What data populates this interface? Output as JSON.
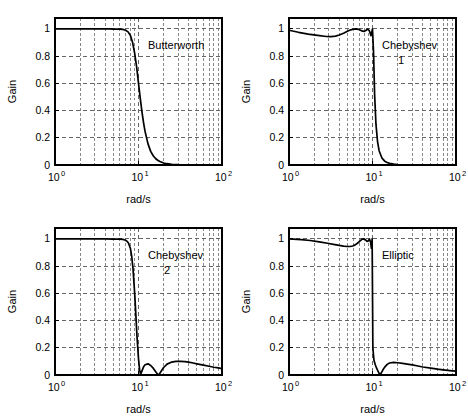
{
  "figure": {
    "title": "",
    "panel_count": 4,
    "background_color": "#ffffff",
    "curve_color": "#000000",
    "grid_color": "#555555",
    "axis_color": "#000000"
  },
  "axes": {
    "xlabel": "rad/s",
    "ylabel": "Gain",
    "x_ticklabels": [
      "10",
      "10",
      "10"
    ],
    "x_tickexponents": [
      "0",
      "1",
      "2"
    ],
    "y_ticklabels": [
      "0",
      "0.2",
      "0.4",
      "0.6",
      "0.8",
      "1"
    ],
    "xlim": [
      1,
      100
    ],
    "ylim": [
      0,
      1.08
    ],
    "xscale": "log",
    "yscale": "linear",
    "grid": true,
    "grid_style": "dashed",
    "y_gridvalues": [
      0.2,
      0.4,
      0.6,
      0.8,
      1.0
    ]
  },
  "chart_data": [
    {
      "type": "line",
      "panel": "top-left",
      "title": "Butterworth",
      "annotation": "Butterworth",
      "xlabel": "rad/s",
      "ylabel": "Gain",
      "xscale": "log",
      "xlim": [
        1,
        100
      ],
      "ylim": [
        0,
        1.08
      ],
      "grid": true,
      "legend": "none",
      "x": [
        1,
        1.5,
        2,
        2.5,
        3,
        3.5,
        4,
        4.5,
        5,
        5.5,
        6,
        6.5,
        7,
        7.5,
        8,
        8.5,
        9,
        9.5,
        10,
        10.5,
        11,
        11.5,
        12,
        13,
        14,
        15,
        16,
        17,
        18,
        20,
        22,
        25,
        30,
        35,
        40,
        50,
        60,
        80,
        100
      ],
      "y": [
        1.0,
        1.0,
        1.0,
        1.0,
        1.0,
        1.0,
        1.0,
        1.0,
        0.999,
        0.999,
        0.998,
        0.996,
        0.99,
        0.978,
        0.952,
        0.9,
        0.82,
        0.72,
        0.6,
        0.49,
        0.39,
        0.31,
        0.245,
        0.155,
        0.1,
        0.068,
        0.048,
        0.035,
        0.026,
        0.015,
        0.0095,
        0.0055,
        0.0022,
        0.0011,
        0.0006,
        0.0002,
        0.0001,
        3e-05,
        1e-05
      ]
    },
    {
      "type": "line",
      "panel": "top-right",
      "title": "Chebyshev 1",
      "annotation": "Chebyshev",
      "annotation_sub": "1",
      "xlabel": "rad/s",
      "ylabel": "Gain",
      "xscale": "log",
      "xlim": [
        1,
        100
      ],
      "ylim": [
        0,
        1.08
      ],
      "grid": true,
      "legend": "none",
      "x": [
        1,
        1.3,
        1.7,
        2.2,
        2.8,
        3.2,
        3.6,
        4.0,
        4.5,
        5.0,
        5.5,
        6.0,
        6.4,
        6.8,
        7.2,
        7.6,
        8.0,
        8.4,
        8.8,
        9.2,
        9.6,
        10.0,
        10.3,
        10.6,
        11,
        11.5,
        12,
        13,
        14,
        15,
        16,
        18,
        20,
        24,
        30,
        40,
        60,
        80,
        100
      ],
      "y": [
        0.99,
        0.975,
        0.962,
        0.952,
        0.944,
        0.943,
        0.947,
        0.955,
        0.968,
        0.982,
        0.993,
        0.999,
        1.0,
        0.997,
        0.99,
        0.983,
        0.982,
        0.99,
        0.999,
        0.985,
        0.95,
        0.999,
        0.82,
        0.52,
        0.3,
        0.17,
        0.105,
        0.05,
        0.028,
        0.018,
        0.012,
        0.006,
        0.0035,
        0.0016,
        0.0006,
        0.0002,
        5e-05,
        2e-05,
        1e-05
      ]
    },
    {
      "type": "line",
      "panel": "bottom-left",
      "title": "Chebyshev 2",
      "annotation": "Chebyshev",
      "annotation_sub": "2",
      "xlabel": "rad/s",
      "ylabel": "Gain",
      "xscale": "log",
      "xlim": [
        1,
        100
      ],
      "ylim": [
        0,
        1.08
      ],
      "grid": true,
      "legend": "none",
      "x": [
        1,
        2,
        3,
        4,
        5,
        5.5,
        6,
        6.5,
        7,
        7.3,
        7.6,
        8,
        8.3,
        8.6,
        9,
        9.3,
        9.6,
        10,
        10.3,
        10.6,
        11,
        11.5,
        12,
        13,
        14,
        15,
        16,
        17,
        17.5,
        18,
        19,
        20,
        22,
        25,
        28,
        32,
        36,
        40,
        45,
        50,
        60,
        70,
        80,
        90,
        100
      ],
      "y": [
        1.0,
        1.0,
        1.0,
        1.0,
        0.999,
        0.999,
        0.998,
        0.996,
        0.99,
        0.982,
        0.968,
        0.93,
        0.87,
        0.78,
        0.6,
        0.44,
        0.28,
        0.12,
        0.04,
        0.005,
        0.03,
        0.06,
        0.075,
        0.082,
        0.07,
        0.05,
        0.025,
        0.004,
        0.002,
        0.012,
        0.035,
        0.055,
        0.08,
        0.095,
        0.1,
        0.1,
        0.098,
        0.094,
        0.088,
        0.082,
        0.072,
        0.064,
        0.057,
        0.052,
        0.047
      ]
    },
    {
      "type": "line",
      "panel": "bottom-right",
      "title": "Elliptic",
      "annotation": "Elliptic",
      "xlabel": "rad/s",
      "ylabel": "Gain",
      "xscale": "log",
      "xlim": [
        1,
        100
      ],
      "ylim": [
        0,
        1.08
      ],
      "grid": true,
      "legend": "none",
      "x": [
        1,
        1.4,
        1.8,
        2.3,
        2.9,
        3.4,
        4.0,
        4.5,
        5.0,
        5.4,
        5.8,
        6.2,
        6.6,
        7.0,
        7.4,
        7.8,
        8.2,
        8.6,
        8.9,
        9.2,
        9.5,
        9.7,
        9.9,
        10.1,
        10.4,
        10.8,
        11.2,
        11.6,
        12,
        12.4,
        12.8,
        13.4,
        14,
        15,
        16,
        18,
        20,
        23,
        26,
        30,
        35,
        40,
        50,
        60,
        70,
        80,
        90,
        100
      ],
      "y": [
        1.0,
        0.995,
        0.988,
        0.978,
        0.968,
        0.96,
        0.952,
        0.947,
        0.944,
        0.944,
        0.948,
        0.956,
        0.968,
        0.982,
        0.995,
        1.0,
        0.995,
        0.982,
        0.985,
        0.998,
        0.975,
        0.93,
        1.0,
        0.2,
        0.11,
        0.075,
        0.05,
        0.03,
        0.012,
        0.004,
        0.018,
        0.04,
        0.058,
        0.078,
        0.088,
        0.093,
        0.09,
        0.085,
        0.08,
        0.074,
        0.066,
        0.059,
        0.05,
        0.043,
        0.038,
        0.034,
        0.031,
        0.028
      ]
    }
  ]
}
